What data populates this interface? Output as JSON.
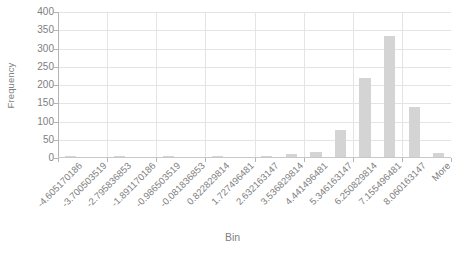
{
  "chart_data": {
    "type": "bar",
    "title": "",
    "xlabel": "Bin",
    "ylabel": "Frequency",
    "ylim": [
      0,
      400
    ],
    "ytick_step": 50,
    "yticks": [
      400,
      350,
      300,
      250,
      200,
      150,
      100,
      50,
      0
    ],
    "grid": true,
    "legend": null,
    "bar_color": "#d4d4d4",
    "grid_color": "#e4e4e4",
    "axis_color": "#b4b4b4",
    "text_color": "#808080",
    "categories": [
      "-4.605170186",
      "-3.700503519",
      "-2.795836853",
      "-1.891170186",
      "-0.986503519",
      "-0.081836853",
      "0.822829814",
      "1.727496481",
      "2.632163147",
      "3.536829814",
      "4.441496481",
      "5.346163147",
      "6.250829814",
      "7.155496481",
      "8.060163147",
      "More"
    ],
    "values": [
      1,
      0,
      1,
      0,
      1,
      0,
      1,
      0,
      1,
      7,
      13,
      73,
      217,
      332,
      136,
      11
    ]
  },
  "axes": {
    "y_title": "Frequency",
    "x_title": "Bin"
  }
}
